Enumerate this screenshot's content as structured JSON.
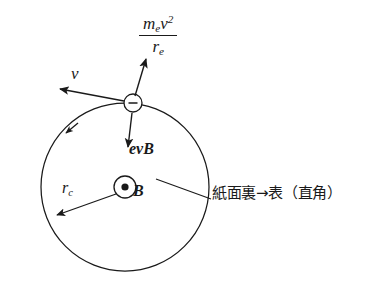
{
  "figure": {
    "background_color": "#ffffff",
    "stroke_color": "#1a1a1a"
  },
  "labels": {
    "centripetal_force": {
      "numerator_m": "m",
      "numerator_m_sub": "e",
      "numerator_v": "v",
      "numerator_v_sup": "2",
      "denominator_r": "r",
      "denominator_r_sub": "e",
      "full_text": "m_e v^2 / r_e"
    },
    "velocity": "v",
    "magnetic_force": "evB",
    "radius_r": "r",
    "radius_sub": "c",
    "field": "B",
    "annotation": "紙面裏→表（直角）"
  },
  "symbols": {
    "electron_charge_sign": "−",
    "field_direction": "out-of-page-dot"
  },
  "geometry": {
    "orbit_center_x": 125,
    "orbit_center_y": 187,
    "orbit_radius": 84,
    "electron_x": 133,
    "electron_y": 103,
    "electron_radius": 9,
    "field_marker_radius": 11
  }
}
